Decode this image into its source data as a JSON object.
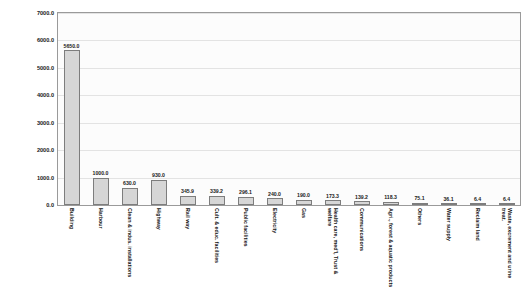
{
  "chart_data": {
    "type": "bar",
    "title": "",
    "xlabel": "",
    "ylabel": "billion yen",
    "ylim": [
      0,
      7000
    ],
    "ytick_labels": [
      "0.0",
      "1000.0",
      "2000.0",
      "3000.0",
      "4000.0",
      "5000.0",
      "6000.0",
      "7000.0"
    ],
    "ytick_values": [
      0,
      1000,
      2000,
      3000,
      4000,
      5000,
      6000,
      7000
    ],
    "grid": true,
    "legend": "none",
    "bar_color": "#d6d6d6",
    "bar_border_color": "#7d7d7d",
    "plot_bg": "#fcfcfc",
    "categories": [
      "Building",
      "Harbour",
      "Clean & indus. installations",
      "Highway",
      "Rail way",
      "Cult. & educ. facilities",
      "Public facilities",
      "Electricity",
      "Gas",
      "Health care, med'l, Trust & welfare",
      "Communications",
      "Agri., forest & aquatic products",
      "Others",
      "Water supply",
      "Reclaim land",
      "Waste, excrement and urine treat."
    ],
    "values": [
      5650.0,
      1000.0,
      630.0,
      930.0,
      345.9,
      339.2,
      296.1,
      240.0,
      190.0,
      173.3,
      139.2,
      118.3,
      75.1,
      36.1,
      6.4,
      6.4
    ],
    "value_labels": [
      "5650.0",
      "1000.0",
      "630.0",
      "930.0",
      "345.9",
      "339.2",
      "296.1",
      "240.0",
      "190.0",
      "173.3",
      "139.2",
      "118.3",
      "75.1",
      "36.1",
      "6.4",
      "6.4"
    ]
  }
}
